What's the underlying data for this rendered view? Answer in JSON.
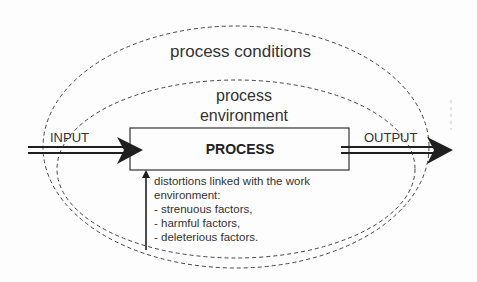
{
  "diagram": {
    "outer_region_label": "process conditions",
    "inner_region_label_line1": "process",
    "inner_region_label_line2": "environment",
    "input_label": "INPUT",
    "output_label": "OUTPUT",
    "process_label": "PROCESS",
    "distortions": {
      "heading_line1": "distortions linked with the work",
      "heading_line2": "environment:",
      "items": [
        "- strenuous factors,",
        "- harmful factors,",
        "- deleterious factors."
      ]
    },
    "colors": {
      "line": "#1f1f1f",
      "dashed": "#444444",
      "background": "#fdfdfd"
    }
  }
}
